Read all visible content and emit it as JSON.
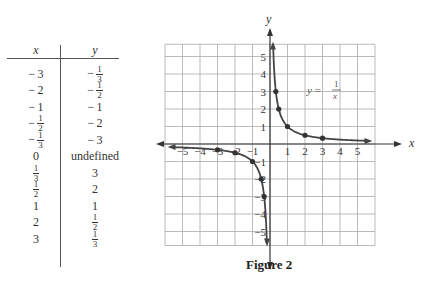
{
  "table": {
    "headers": [
      "x",
      "y"
    ],
    "rows": [
      {
        "x": {
          "neg": true,
          "whole": "3"
        },
        "y": {
          "neg": true,
          "num": "1",
          "den": "3"
        }
      },
      {
        "x": {
          "neg": true,
          "whole": "2"
        },
        "y": {
          "neg": true,
          "num": "1",
          "den": "2"
        }
      },
      {
        "x": {
          "neg": true,
          "whole": "1"
        },
        "y": {
          "neg": true,
          "whole": "1"
        }
      },
      {
        "x": {
          "neg": true,
          "num": "1",
          "den": "2"
        },
        "y": {
          "neg": true,
          "whole": "2"
        }
      },
      {
        "x": {
          "neg": true,
          "num": "1",
          "den": "3"
        },
        "y": {
          "neg": true,
          "whole": "3"
        }
      },
      {
        "x": {
          "whole": "0"
        },
        "y": {
          "text": "undefined"
        }
      },
      {
        "x": {
          "num": "1",
          "den": "3"
        },
        "y": {
          "whole": "3"
        }
      },
      {
        "x": {
          "num": "1",
          "den": "2"
        },
        "y": {
          "whole": "2"
        }
      },
      {
        "x": {
          "whole": "1"
        },
        "y": {
          "whole": "1"
        }
      },
      {
        "x": {
          "whole": "2"
        },
        "y": {
          "num": "1",
          "den": "2"
        }
      },
      {
        "x": {
          "whole": "3"
        },
        "y": {
          "num": "1",
          "den": "3"
        }
      }
    ]
  },
  "caption": "Figure 2",
  "chart_data": {
    "type": "line",
    "title": "",
    "function_label": "y = 1/x",
    "xlabel": "x",
    "ylabel": "y",
    "xlim": [
      -6,
      6
    ],
    "ylim": [
      -6,
      6
    ],
    "grid": true,
    "x_ticks": [
      -5,
      -4,
      -3,
      -2,
      -1,
      1,
      2,
      3,
      4,
      5
    ],
    "y_ticks": [
      -5,
      -4,
      -3,
      -2,
      -1,
      1,
      2,
      3,
      4,
      5
    ],
    "series": [
      {
        "name": "y = 1/x",
        "points": [
          [
            -3,
            -0.3333
          ],
          [
            -2,
            -0.5
          ],
          [
            -1,
            -1
          ],
          [
            -0.5,
            -2
          ],
          [
            -0.3333,
            -3
          ],
          [
            0.3333,
            3
          ],
          [
            0.5,
            2
          ],
          [
            1,
            1
          ],
          [
            2,
            0.5
          ],
          [
            3,
            0.3333
          ]
        ]
      }
    ],
    "asymptotes": {
      "vertical": 0,
      "horizontal": 0
    }
  }
}
